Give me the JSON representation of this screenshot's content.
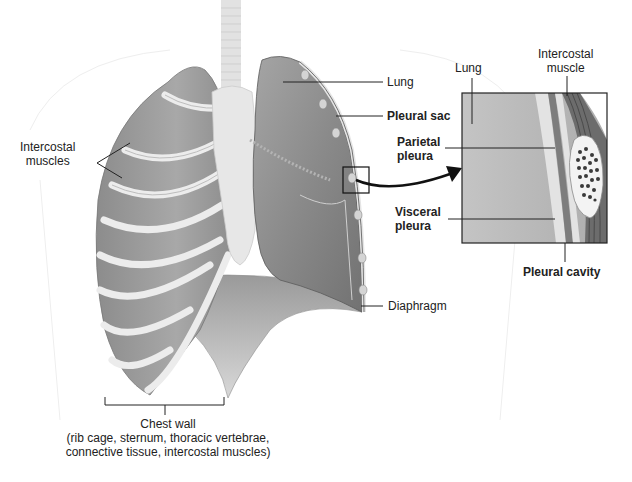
{
  "figure": {
    "colors": {
      "lung": "#8e8e8e",
      "lung_dark": "#6f6f6f",
      "rib": "#e6e6e6",
      "muscle": "#9a9a9a",
      "line": "#222222",
      "inset_bg": "#b9b9b9"
    }
  },
  "labels": {
    "intercostal_muscles": [
      "Intercostal",
      "muscles"
    ],
    "lung": "Lung",
    "pleural_sac": "Pleural sac",
    "parietal_pleura": [
      "Parietal",
      "pleura"
    ],
    "visceral_pleura": [
      "Visceral",
      "pleura"
    ],
    "diaphragm": "Diaphragm",
    "inset_lung": "Lung",
    "inset_intercostal_muscle": [
      "Intercostal",
      "muscle"
    ],
    "pleural_cavity": "Pleural cavity",
    "chest_wall": "Chest wall",
    "chest_wall_detail": [
      "(rib cage, sternum, thoracic vertebrae,",
      "connective tissue, intercostal muscles)"
    ]
  }
}
